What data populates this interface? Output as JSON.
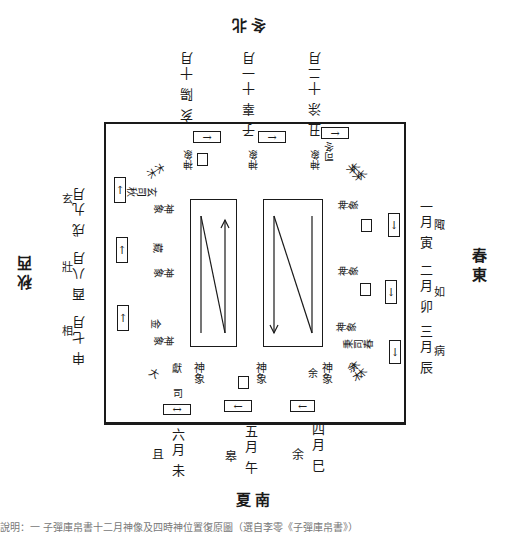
{
  "directions": {
    "north": "冬北",
    "south": "夏南",
    "east": "春東",
    "west": "秋西"
  },
  "months": {
    "north": [
      {
        "month": "十月",
        "name": "陽",
        "branch": "亥"
      },
      {
        "month": "十一月",
        "name": "辜",
        "branch": "子"
      },
      {
        "month": "十二月",
        "name": "涂",
        "branch": "丑"
      }
    ],
    "east": [
      {
        "month": "一月",
        "name": "陬",
        "branch": "寅"
      },
      {
        "month": "二月",
        "name": "如",
        "branch": "卯"
      },
      {
        "month": "三月",
        "name": "病",
        "branch": "辰"
      }
    ],
    "south": [
      {
        "month": "四月",
        "name": "余",
        "branch": "巳"
      },
      {
        "month": "五月",
        "name": "皋",
        "branch": "午"
      },
      {
        "month": "六月",
        "name": "且",
        "branch": "未"
      }
    ],
    "west": [
      {
        "month": "七月",
        "name": "相",
        "branch": "申"
      },
      {
        "month": "八月",
        "name": "壯",
        "branch": "酉"
      },
      {
        "month": "九月",
        "name": "玄",
        "branch": "戌"
      }
    ]
  },
  "inner_labels": {
    "south_1": "神象",
    "south_1b": "獻",
    "south_1c": "司",
    "south_1d": "夏",
    "south_1e": "大",
    "south_2": "神象",
    "south_3": "神象",
    "south_3b": "余",
    "south_4": "余木",
    "east_1": "神象",
    "east_2": "神象",
    "east_3": "神象",
    "east_3b": "秉司春",
    "east_3c": "木木",
    "east_4": "木木",
    "north_1": "神象",
    "north_2": "神象",
    "north_3": "神象",
    "north_3b": "司冬",
    "north_4": "木木",
    "west_1": "神象",
    "west_1b": "玄司秋",
    "west_1c": "木木",
    "west_2": "神象",
    "west_2b": "藏",
    "west_3": "神象",
    "west_3b": "金"
  },
  "arrows": {
    "right": "→",
    "left": "←",
    "up": "↑",
    "down": "↓",
    "both": "↔"
  },
  "caption": "說明：一 子彈庫帛書十二月神像及四時神位置復原圖（選自李零《子彈庫帛書》）"
}
